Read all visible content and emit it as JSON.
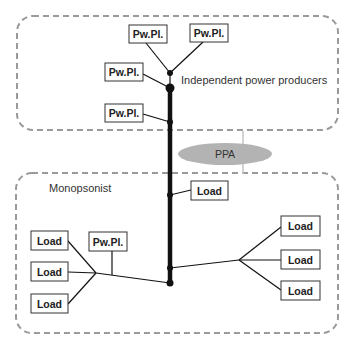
{
  "diagram": {
    "regions": [
      {
        "id": "ipp",
        "label": "Independent power producers",
        "x": 17,
        "y": 16,
        "w": 321,
        "h": 114
      },
      {
        "id": "monopsonist",
        "label": "Monopsonist",
        "x": 16,
        "y": 173,
        "w": 322,
        "h": 160
      }
    ],
    "contract": {
      "label": "PPA",
      "cx": 225,
      "cy": 154,
      "rx": 47,
      "ry": 11
    },
    "boxes": [
      {
        "id": "pp1",
        "label": "Pw.Pl.",
        "x": 129,
        "y": 25,
        "w": 38,
        "h": 18
      },
      {
        "id": "pp2",
        "label": "Pw.Pl.",
        "x": 190,
        "y": 24,
        "w": 38,
        "h": 18
      },
      {
        "id": "pp3",
        "label": "Pw.Pl.",
        "x": 105,
        "y": 63,
        "w": 38,
        "h": 18
      },
      {
        "id": "pp4",
        "label": "Pw.Pl.",
        "x": 105,
        "y": 104,
        "w": 38,
        "h": 18
      },
      {
        "id": "load_center",
        "label": "Load",
        "x": 191,
        "y": 181,
        "w": 37,
        "h": 19
      },
      {
        "id": "load_l1",
        "label": "Load",
        "x": 31,
        "y": 231,
        "w": 37,
        "h": 19
      },
      {
        "id": "load_l2",
        "label": "Load",
        "x": 31,
        "y": 262,
        "w": 37,
        "h": 19
      },
      {
        "id": "load_l3",
        "label": "Load",
        "x": 31,
        "y": 294,
        "w": 37,
        "h": 19
      },
      {
        "id": "pp_local",
        "label": "Pw.Pl.",
        "x": 89,
        "y": 232,
        "w": 38,
        "h": 19
      },
      {
        "id": "load_r1",
        "label": "Load",
        "x": 281,
        "y": 216,
        "w": 39,
        "h": 20
      },
      {
        "id": "load_r2",
        "label": "Load",
        "x": 281,
        "y": 250,
        "w": 39,
        "h": 19
      },
      {
        "id": "load_r3",
        "label": "Load",
        "x": 281,
        "y": 281,
        "w": 39,
        "h": 19
      }
    ],
    "colors": {
      "dashed_border": "#9a9a9a",
      "ppa_fill": "#b3b3b3",
      "line": "#111111",
      "box_border": "#333333"
    }
  }
}
